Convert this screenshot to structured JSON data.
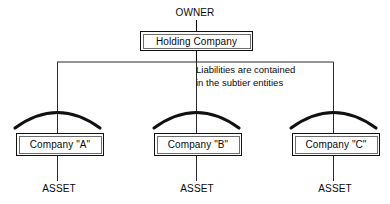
{
  "diagram": {
    "title_label": "OWNER",
    "note": {
      "line1": "Liabilities are contained",
      "line2": "in the subtier entities"
    },
    "holding": {
      "label": "Holding Company"
    },
    "companies": [
      {
        "label": "Company \"A\"",
        "asset_label": "ASSET"
      },
      {
        "label": "Company \"B\"",
        "asset_label": "ASSET"
      },
      {
        "label": "Company \"C\"",
        "asset_label": "ASSET"
      }
    ],
    "colors": {
      "background": "#ffffff",
      "line": "#111111",
      "thin_line": "#6e6e6e",
      "text": "#0a0a0a"
    }
  }
}
